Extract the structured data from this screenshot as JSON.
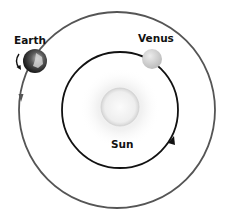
{
  "diagram": {
    "title": "",
    "labels": {
      "earth": "Earth",
      "venus": "Venus",
      "sun": "Sun"
    },
    "bodies": [
      {
        "name": "Sun",
        "role": "star"
      },
      {
        "name": "Venus",
        "role": "inner planet"
      },
      {
        "name": "Earth",
        "role": "outer planet"
      }
    ],
    "orbits": [
      {
        "name": "Venus orbit",
        "color": "#111111",
        "direction": "counter-clockwise"
      },
      {
        "name": "Earth orbit",
        "color": "#555555",
        "direction": "counter-clockwise"
      }
    ],
    "colors": {
      "outer_orbit": "#555555",
      "inner_orbit": "#111111",
      "sun_core": "#e6e6e6",
      "venus": "#cfcfcf",
      "earth": "#2a2a2a"
    }
  }
}
